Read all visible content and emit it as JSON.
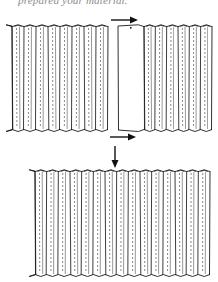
{
  "caption": {
    "text": "prepared your material."
  },
  "figure": {
    "panels": [
      {
        "id": "top-left",
        "pleats": 8,
        "x": 12,
        "y": 26,
        "w": 96,
        "h": 104
      },
      {
        "id": "top-right",
        "pleats": 6,
        "flat_left_section": true,
        "x": 118,
        "y": 26,
        "w": 94,
        "h": 104
      },
      {
        "id": "bottom-combined",
        "pleats": 15,
        "x": 35,
        "y": 171,
        "w": 175,
        "h": 104
      }
    ],
    "arrows": [
      {
        "id": "arrow-right-top",
        "direction": "right"
      },
      {
        "id": "arrow-right-bottom",
        "direction": "right"
      },
      {
        "id": "arrow-down",
        "direction": "down"
      }
    ],
    "colors": {
      "line": "#1a1a1a",
      "stitch": "#555555",
      "background": "#ffffff"
    }
  }
}
